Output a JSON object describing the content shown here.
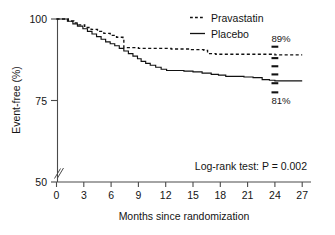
{
  "figure": {
    "kind": "kaplan-meier-survival-plot",
    "background": "#ffffff",
    "ink_color": "#111111"
  },
  "axes": {
    "y_label": "Event-free (%)",
    "x_label": "Months since randomization",
    "y_ticks": [
      "100",
      "75",
      "50"
    ],
    "x_ticks": [
      "0",
      "3",
      "6",
      "9",
      "12",
      "15",
      "18",
      "21",
      "24",
      "27"
    ],
    "y_axis_break": "//"
  },
  "legend": {
    "position": "top-right",
    "entries": [
      {
        "label": "Pravastatin",
        "style": "dashed",
        "sample": "- - -"
      },
      {
        "label": "Placebo",
        "style": "solid",
        "sample": "—"
      }
    ]
  },
  "annotations": {
    "pravastatin_endpoint": "89%",
    "placebo_endpoint": "81%",
    "statistic": "Log-rank test: P = 0.002"
  },
  "chart_data": {
    "type": "line",
    "title": "",
    "subtitle": "",
    "xlabel": "Months since randomization",
    "ylabel": "Event-free (%)",
    "xlim": [
      0,
      27
    ],
    "ylim": [
      50,
      100
    ],
    "grid": false,
    "legend_position": "top-right",
    "y_axis_broken_below": 75,
    "annotation_labels": {
      "pravastatin_24mo": "89%",
      "placebo_24mo": "81%",
      "log_rank": "Log-rank test: P = 0.002"
    },
    "series": [
      {
        "name": "Pravastatin",
        "style": "dashed",
        "step_type": "post",
        "x": [
          0,
          0.7,
          1.3,
          1.9,
          2.4,
          3.1,
          3.8,
          4.5,
          5.2,
          5.9,
          6.6,
          7.3,
          7.4,
          8.2,
          9.0,
          9.9,
          10.8,
          11.7,
          12.6,
          13.6,
          14.6,
          15.6,
          16.2,
          16.6,
          17.5,
          18.6,
          19.8,
          21.0,
          22.2,
          23.4,
          24.0,
          25.2,
          27.0
        ],
        "y": [
          100.0,
          100.0,
          99.4,
          98.8,
          98.2,
          97.4,
          96.8,
          96.2,
          95.6,
          95.0,
          94.4,
          93.8,
          91.2,
          91.2,
          91.0,
          91.0,
          91.0,
          91.0,
          90.8,
          90.8,
          90.6,
          90.6,
          90.4,
          89.4,
          89.2,
          89.2,
          89.2,
          89.2,
          89.2,
          89.2,
          89.0,
          89.0,
          89.0
        ],
        "endpoint_value": 89
      },
      {
        "name": "Placebo",
        "style": "solid",
        "step_type": "post",
        "x": [
          0,
          0.6,
          1.2,
          1.8,
          2.3,
          2.9,
          3.4,
          3.9,
          4.4,
          4.9,
          5.4,
          5.9,
          6.4,
          6.9,
          7.4,
          7.9,
          8.4,
          8.9,
          9.3,
          9.8,
          10.3,
          10.9,
          11.5,
          12.1,
          13.0,
          14.0,
          15.0,
          16.0,
          17.0,
          17.8,
          18.6,
          19.6,
          20.6,
          21.6,
          22.6,
          23.4,
          24.0,
          25.0,
          27.0
        ],
        "y": [
          100.0,
          100.0,
          99.3,
          98.5,
          97.8,
          97.0,
          96.2,
          95.4,
          94.6,
          93.8,
          93.0,
          92.4,
          91.8,
          91.0,
          90.2,
          89.4,
          88.6,
          87.8,
          87.0,
          86.4,
          85.8,
          85.2,
          84.6,
          84.2,
          84.2,
          84.0,
          83.8,
          83.4,
          83.0,
          82.8,
          82.4,
          82.4,
          82.2,
          82.0,
          81.4,
          81.2,
          81.0,
          81.0,
          81.0
        ],
        "endpoint_value": 81
      }
    ],
    "error_bars_at_month": 24,
    "error_bar_ticks_y": [
      91.5,
      88.0,
      85.5,
      83.0,
      80.3,
      77.5
    ]
  }
}
